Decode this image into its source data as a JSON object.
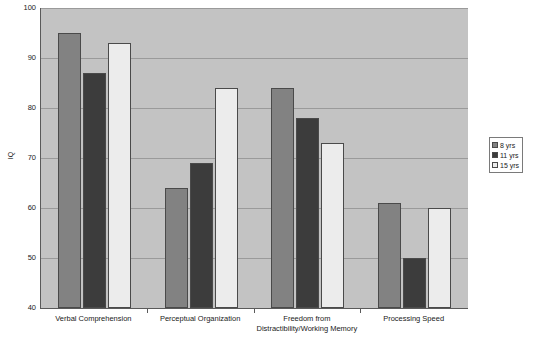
{
  "chart_data": {
    "type": "bar",
    "title": "",
    "xlabel": "",
    "ylabel": "IQ",
    "ylim": [
      40,
      100
    ],
    "yticks": [
      100,
      90,
      80,
      70,
      60,
      50,
      40
    ],
    "grid": true,
    "legend_position": "right",
    "categories": [
      "Verbal Comprehension",
      "Perceptual Organization",
      "Freedom from\nDistractibility/Working Memory",
      "Processing Speed"
    ],
    "series": [
      {
        "name": "8 yrs",
        "values": [
          95,
          64,
          84,
          61
        ]
      },
      {
        "name": "11 yrs",
        "values": [
          87,
          69,
          78,
          50
        ]
      },
      {
        "name": "15 yrs",
        "values": [
          93,
          84,
          73,
          60
        ]
      }
    ]
  },
  "colors": {
    "series_8yrs": "#828282",
    "series_11yrs": "#3c3c3c",
    "series_15yrs": "#ececec",
    "plot_background": "#c3c3c3",
    "gridline": "#9a9a9a",
    "axis": "#5a5a5a",
    "text": "#1a1a1a",
    "page_background": "#ffffff"
  },
  "legend": {
    "items": [
      {
        "label": "8 yrs"
      },
      {
        "label": "11 yrs"
      },
      {
        "label": "15 yrs"
      }
    ]
  }
}
